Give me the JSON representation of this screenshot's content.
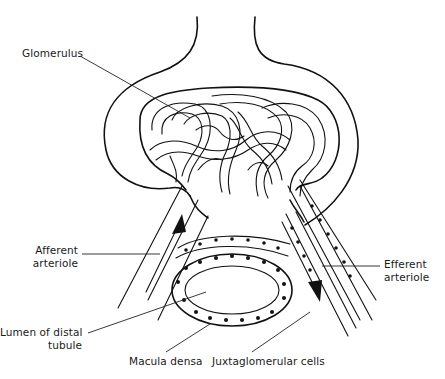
{
  "figure": {
    "type": "anatomical line drawing"
  },
  "labels": {
    "glomerulus": "Glomerulus",
    "afferent_line1": "Afferent",
    "afferent_line2": "arteriole",
    "efferent_line1": "Efferent",
    "efferent_line2": "arteriole",
    "lumen_line1": "Lumen of distal",
    "lumen_line2": "tubule",
    "macula_densa": "Macula densa",
    "juxtaglomerular": "Juxtaglomerular cells"
  },
  "arrows": {
    "afferent_flow": "up",
    "efferent_flow": "down"
  },
  "colors": {
    "ink": "#111111",
    "background": "#ffffff"
  }
}
